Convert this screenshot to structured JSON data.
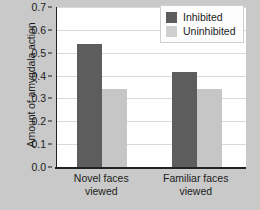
{
  "chart_data": {
    "type": "bar",
    "title": "",
    "xlabel": "",
    "ylabel": "Amount of amygdala action",
    "categories": [
      "Novel faces viewed",
      "Familiar faces viewed"
    ],
    "category_lines": [
      [
        "Novel faces",
        "viewed"
      ],
      [
        "Familiar faces",
        "viewed"
      ]
    ],
    "series": [
      {
        "name": "Inhibited",
        "color": "#5d5d5d",
        "values": [
          0.54,
          0.415
        ]
      },
      {
        "name": "Uninhibited",
        "color": "#c6c6c6",
        "values": [
          0.34,
          0.34
        ]
      }
    ],
    "ylim": [
      0.0,
      0.7
    ],
    "yticks": [
      "0.0",
      "0.1",
      "0.2",
      "0.3",
      "0.4",
      "0.5",
      "0.6",
      "0.7"
    ],
    "ytick_values": [
      0.0,
      0.1,
      0.2,
      0.3,
      0.4,
      0.5,
      0.6,
      0.7
    ],
    "grid": true,
    "legend_position": "top-right",
    "background_color": "#c9c9c9",
    "plot_background_color": "#ffffff"
  },
  "legend": {
    "entries": [
      {
        "label": "Inhibited"
      },
      {
        "label": "Uninhibited"
      }
    ]
  }
}
